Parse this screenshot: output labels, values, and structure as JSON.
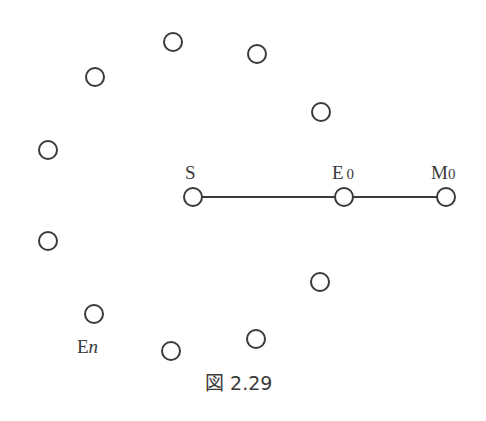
{
  "figure": {
    "caption": "図 2.29",
    "stroke_color": "#3a3a3a",
    "labels": {
      "S": "S",
      "E0_main": "E",
      "E0_sub": "0",
      "M0_main": "M",
      "M0_sub": "0",
      "En_main": "E",
      "En_sub": "n"
    },
    "nodes": [
      {
        "id": "S",
        "x": 193,
        "y": 197
      },
      {
        "id": "E0",
        "x": 344,
        "y": 197
      },
      {
        "id": "M0",
        "x": 446,
        "y": 197
      },
      {
        "id": "E1",
        "x": 320,
        "y": 282
      },
      {
        "id": "E2",
        "x": 256,
        "y": 339
      },
      {
        "id": "E3",
        "x": 171,
        "y": 351
      },
      {
        "id": "En",
        "x": 94,
        "y": 314
      },
      {
        "id": "E5",
        "x": 48,
        "y": 241
      },
      {
        "id": "E6",
        "x": 48,
        "y": 150
      },
      {
        "id": "E7",
        "x": 95,
        "y": 77
      },
      {
        "id": "E8",
        "x": 173,
        "y": 42
      },
      {
        "id": "E9",
        "x": 257,
        "y": 54
      },
      {
        "id": "E10",
        "x": 321,
        "y": 112
      }
    ],
    "edges": [
      [
        "S",
        "E0"
      ],
      [
        "E0",
        "M0"
      ]
    ]
  }
}
